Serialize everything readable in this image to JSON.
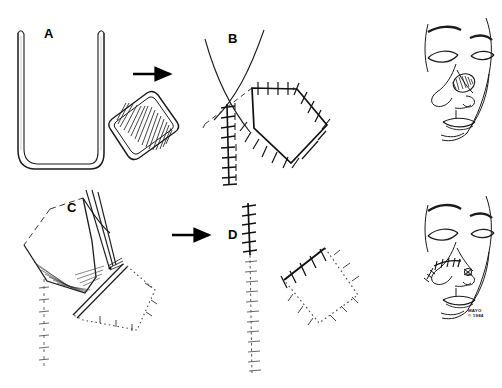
{
  "figure": {
    "background_color": "#ffffff",
    "ink_color": "#000000",
    "width": 502,
    "height": 388
  },
  "panels": [
    {
      "id": "A",
      "label": "A",
      "label_x": 44,
      "label_y": 27,
      "caption": "Donor site template and harvested hatched rhomboid composite graft"
    },
    {
      "id": "B",
      "label": "B",
      "label_x": 228,
      "label_y": 32,
      "caption": "Donor site closed with interrupted sutures and sutured rhomboid defect margins"
    },
    {
      "id": "C",
      "label": "C",
      "label_x": 67,
      "label_y": 201,
      "caption": "Flap elevated and transposed with instrument toward dotted recipient rhomboid"
    },
    {
      "id": "D",
      "label": "D",
      "label_x": 228,
      "label_y": 228,
      "caption": "Completed suture line closure of donor site and inset graft"
    }
  ],
  "arrows": [
    {
      "name": "arrow-a-to-graft",
      "x": 133,
      "y": 74,
      "length": 40,
      "direction": "right"
    },
    {
      "name": "arrow-c-to-d",
      "x": 172,
      "y": 235,
      "length": 40,
      "direction": "right"
    }
  ],
  "faces": [
    {
      "id": "face-top",
      "label": "Preoperative oblique facial view with nasal lesion outlined",
      "x": 410,
      "y": 18
    },
    {
      "id": "face-bottom",
      "label": "Postoperative oblique facial view with sutured nasal graft",
      "x": 410,
      "y": 195
    }
  ],
  "watermark": {
    "line1": "MAYO",
    "line2": "© 1984",
    "x": 468,
    "y": 308
  }
}
